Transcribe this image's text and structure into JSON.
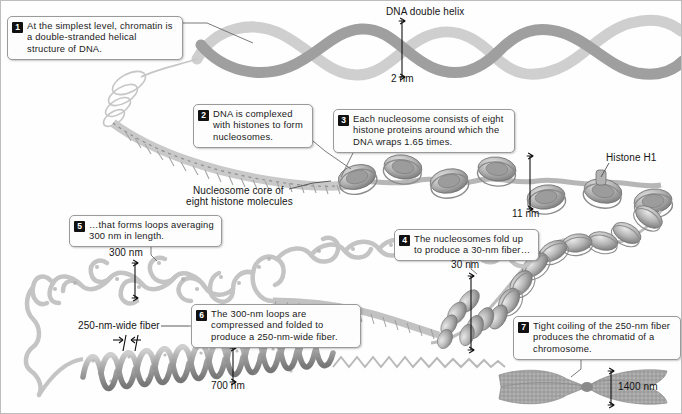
{
  "figure": {
    "type": "biology-diagram",
    "palette": {
      "background": "#fefefe",
      "dna_light": "#d9d9d9",
      "dna_mid": "#a8a8a8",
      "dna_dark": "#808080",
      "chromosome": "#8f8f8f",
      "text": "#1a1a1a",
      "callout_border": "#9a9a9a",
      "callout_fill": "#fdfdfd",
      "badge_fill": "#111111",
      "badge_text": "#ffffff"
    }
  },
  "callouts": [
    {
      "number": "1",
      "text": "At the simplest level, chromatin is a double-stranded helical structure of DNA.",
      "x": 6,
      "y": 15,
      "w": 176,
      "h": 44,
      "leader": "M182,22 L205,22 L250,40"
    },
    {
      "number": "2",
      "text": "DNA is complexed with histones to form nucleosomes.",
      "x": 192,
      "y": 103,
      "w": 120,
      "h": 44,
      "leader": "M312,140 L330,152 L352,166"
    },
    {
      "number": "3",
      "text": "Each nucleosome consists of eight histone proteins around which the DNA wraps 1.65 times.",
      "x": 332,
      "y": 108,
      "w": 182,
      "h": 44,
      "leader": "M352,152 L346,166 L338,178"
    },
    {
      "number": "4",
      "text": "The nucleosomes fold up to produce a 30-nm fiber…",
      "x": 393,
      "y": 228,
      "w": 145,
      "h": 32,
      "leader": "M470,260 L470,268 L478,274"
    },
    {
      "number": "5",
      "text": "…that forms loops averaging 300 nm in length.",
      "x": 68,
      "y": 214,
      "w": 153,
      "h": 32,
      "leader": "M150,246 L150,254 L158,260"
    },
    {
      "number": "6",
      "text": "The 300-nm loops are compressed and folded to produce a 250-nm-wide fiber.",
      "x": 190,
      "y": 303,
      "w": 170,
      "h": 44,
      "leader": "M190,325 L160,325 L140,340"
    },
    {
      "number": "7",
      "text": "Tight coiling of the 250-nm fiber produces the chromatid of a chromosome.",
      "x": 512,
      "y": 315,
      "w": 168,
      "h": 44,
      "leader": "M580,359 L580,368 L572,376"
    }
  ],
  "labels": [
    {
      "name": "dna-double-helix",
      "text": "DNA double helix",
      "x": 385,
      "y": 6
    },
    {
      "name": "histone-h1",
      "text": "Histone H1",
      "x": 605,
      "y": 152
    },
    {
      "name": "nucleosome-core",
      "text": "Nucleosome core of",
      "x": 192,
      "y": 185
    },
    {
      "name": "nucleosome-core-2",
      "text": "eight histone molecules",
      "x": 185,
      "y": 196
    },
    {
      "name": "fiber-250-wide",
      "text": "250-nm-wide fiber",
      "x": 77,
      "y": 325
    }
  ],
  "dimensions": [
    {
      "name": "dim-2nm",
      "text": "2 nm",
      "x": 390,
      "y": 78,
      "line_x": 401,
      "line_y1": 20,
      "line_y2": 76,
      "orient": "v"
    },
    {
      "name": "dim-11nm",
      "text": "11 nm",
      "x": 513,
      "y": 211,
      "line_x": 529,
      "line_y1": 155,
      "line_y2": 208,
      "orient": "v"
    },
    {
      "name": "dim-30nm",
      "text": "30 nm",
      "x": 452,
      "y": 262,
      "line_x": 470,
      "line_y1": 275,
      "line_y2": 349,
      "orient": "v"
    },
    {
      "name": "dim-300nm",
      "text": "300 nm",
      "x": 110,
      "y": 249,
      "line_x": 134,
      "line_y1": 262,
      "line_y2": 297,
      "orient": "v"
    },
    {
      "name": "dim-700nm",
      "text": "700 nm",
      "x": 212,
      "y": 383,
      "line_x": 232,
      "line_y1": 347,
      "line_y2": 381,
      "orient": "v"
    },
    {
      "name": "dim-1400nm",
      "text": "1400 nm",
      "x": 618,
      "y": 384,
      "line_x": 610,
      "line_y1": 370,
      "line_y2": 404,
      "orient": "v"
    }
  ],
  "structures": [
    {
      "name": "dna-double-helix-strand",
      "level": 1,
      "width_nm": 2
    },
    {
      "name": "beads-on-string-fiber",
      "level": 2,
      "width_nm": 11
    },
    {
      "name": "nucleosome-array",
      "level": 3,
      "wraps": 1.65,
      "histones": 8
    },
    {
      "name": "thirty-nm-fiber",
      "level": 4,
      "width_nm": 30
    },
    {
      "name": "looped-domain-fiber",
      "level": 5,
      "loop_nm": 300
    },
    {
      "name": "condensed-fiber",
      "level": 6,
      "width_nm": 250,
      "coil_nm": 700
    },
    {
      "name": "metaphase-chromosome",
      "level": 7,
      "width_nm": 1400
    }
  ]
}
